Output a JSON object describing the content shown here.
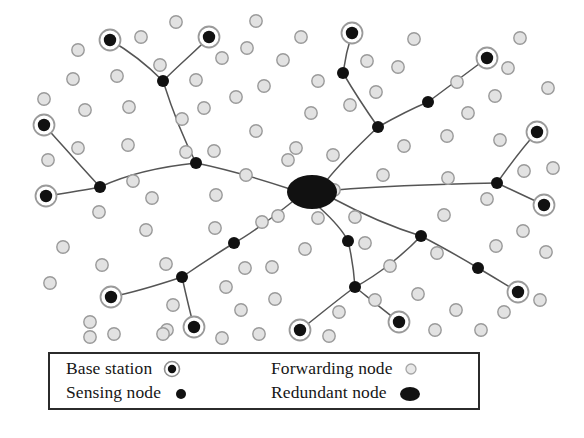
{
  "figure": {
    "background_color": "#ffffff"
  },
  "colors": {
    "base_station_ring": "#9a9a9a",
    "base_station_core": "#111111",
    "sensing_node": "#111111",
    "forwarding_node_fill": "#e2e2e2",
    "forwarding_node_stroke": "#9a9a9a",
    "redundant_node": "#111111",
    "link_line": "#555555",
    "legend_border": "#2b2b2b",
    "legend_text": "#161616"
  },
  "legend": {
    "items": [
      {
        "label": "Base station",
        "symbol": "base-station-symbol",
        "column": "left",
        "row": 1
      },
      {
        "label": "Sensing node",
        "symbol": "sensing-node-symbol",
        "column": "left",
        "row": 2
      },
      {
        "label": "Forwarding node",
        "symbol": "forwarding-node-symbol",
        "column": "right",
        "row": 1
      },
      {
        "label": "Redundant node",
        "symbol": "redundant-node-symbol",
        "column": "right",
        "row": 2
      }
    ]
  },
  "network": {
    "redundant_nodes": [
      {
        "id": "hub",
        "cx": 312,
        "cy": 192,
        "rx": 25,
        "ry": 17
      }
    ],
    "base_stations": [
      {
        "id": "bs1",
        "cx": 110,
        "cy": 40
      },
      {
        "id": "bs2",
        "cx": 209,
        "cy": 37
      },
      {
        "id": "bs3",
        "cx": 352,
        "cy": 33
      },
      {
        "id": "bs4",
        "cx": 487,
        "cy": 58
      },
      {
        "id": "bs5",
        "cx": 44,
        "cy": 125
      },
      {
        "id": "bs6",
        "cx": 537,
        "cy": 132
      },
      {
        "id": "bs7",
        "cx": 46,
        "cy": 196
      },
      {
        "id": "bs8",
        "cx": 544,
        "cy": 205
      },
      {
        "id": "bs9",
        "cx": 111,
        "cy": 297
      },
      {
        "id": "bs10",
        "cx": 194,
        "cy": 327
      },
      {
        "id": "bs11",
        "cx": 300,
        "cy": 330
      },
      {
        "id": "bs12",
        "cx": 399,
        "cy": 322
      },
      {
        "id": "bs13",
        "cx": 518,
        "cy": 292
      }
    ],
    "sensing_nodes": [
      {
        "id": "s1",
        "cx": 163,
        "cy": 81
      },
      {
        "id": "s2",
        "cx": 343,
        "cy": 73
      },
      {
        "id": "s3",
        "cx": 428,
        "cy": 102
      },
      {
        "id": "s4",
        "cx": 378,
        "cy": 127
      },
      {
        "id": "s5",
        "cx": 196,
        "cy": 163
      },
      {
        "id": "s6",
        "cx": 100,
        "cy": 187
      },
      {
        "id": "s7",
        "cx": 497,
        "cy": 183
      },
      {
        "id": "s8",
        "cx": 421,
        "cy": 236
      },
      {
        "id": "s9",
        "cx": 234,
        "cy": 243
      },
      {
        "id": "s10",
        "cx": 348,
        "cy": 241
      },
      {
        "id": "s11",
        "cx": 182,
        "cy": 277
      },
      {
        "id": "s12",
        "cx": 355,
        "cy": 287
      },
      {
        "id": "s13",
        "cx": 478,
        "cy": 268
      }
    ],
    "forwarding_nodes": [
      {
        "cx": 78,
        "cy": 50
      },
      {
        "cx": 141,
        "cy": 37
      },
      {
        "cx": 160,
        "cy": 65
      },
      {
        "cx": 176,
        "cy": 22
      },
      {
        "cx": 222,
        "cy": 58
      },
      {
        "cx": 247,
        "cy": 48
      },
      {
        "cx": 256,
        "cy": 21
      },
      {
        "cx": 196,
        "cy": 80
      },
      {
        "cx": 73,
        "cy": 79
      },
      {
        "cx": 117,
        "cy": 76
      },
      {
        "cx": 129,
        "cy": 107
      },
      {
        "cx": 44,
        "cy": 99
      },
      {
        "cx": 48,
        "cy": 160
      },
      {
        "cx": 78,
        "cy": 148
      },
      {
        "cx": 128,
        "cy": 145
      },
      {
        "cx": 99,
        "cy": 212
      },
      {
        "cx": 63,
        "cy": 247
      },
      {
        "cx": 50,
        "cy": 283
      },
      {
        "cx": 90,
        "cy": 322
      },
      {
        "cx": 90,
        "cy": 337
      },
      {
        "cx": 152,
        "cy": 198
      },
      {
        "cx": 146,
        "cy": 230
      },
      {
        "cx": 166,
        "cy": 264
      },
      {
        "cx": 173,
        "cy": 305
      },
      {
        "cx": 102,
        "cy": 265
      },
      {
        "cx": 133,
        "cy": 181
      },
      {
        "cx": 182,
        "cy": 119
      },
      {
        "cx": 186,
        "cy": 152
      },
      {
        "cx": 216,
        "cy": 195
      },
      {
        "cx": 215,
        "cy": 228
      },
      {
        "cx": 226,
        "cy": 287
      },
      {
        "cx": 241,
        "cy": 310
      },
      {
        "cx": 259,
        "cy": 334
      },
      {
        "cx": 245,
        "cy": 268
      },
      {
        "cx": 262,
        "cy": 222
      },
      {
        "cx": 246,
        "cy": 175
      },
      {
        "cx": 214,
        "cy": 151
      },
      {
        "cx": 256,
        "cy": 131
      },
      {
        "cx": 264,
        "cy": 86
      },
      {
        "cx": 283,
        "cy": 60
      },
      {
        "cx": 301,
        "cy": 37
      },
      {
        "cx": 318,
        "cy": 81
      },
      {
        "cx": 311,
        "cy": 113
      },
      {
        "cx": 288,
        "cy": 160
      },
      {
        "cx": 272,
        "cy": 267
      },
      {
        "cx": 275,
        "cy": 299
      },
      {
        "cx": 305,
        "cy": 249
      },
      {
        "cx": 318,
        "cy": 218
      },
      {
        "cx": 334,
        "cy": 190
      },
      {
        "cx": 333,
        "cy": 155
      },
      {
        "cx": 350,
        "cy": 105
      },
      {
        "cx": 367,
        "cy": 61
      },
      {
        "cx": 376,
        "cy": 92
      },
      {
        "cx": 398,
        "cy": 67
      },
      {
        "cx": 414,
        "cy": 39
      },
      {
        "cx": 404,
        "cy": 146
      },
      {
        "cx": 383,
        "cy": 175
      },
      {
        "cx": 355,
        "cy": 217
      },
      {
        "cx": 339,
        "cy": 312
      },
      {
        "cx": 375,
        "cy": 300
      },
      {
        "cx": 390,
        "cy": 266
      },
      {
        "cx": 418,
        "cy": 294
      },
      {
        "cx": 437,
        "cy": 253
      },
      {
        "cx": 444,
        "cy": 215
      },
      {
        "cx": 448,
        "cy": 178
      },
      {
        "cx": 447,
        "cy": 136
      },
      {
        "cx": 468,
        "cy": 113
      },
      {
        "cx": 457,
        "cy": 82
      },
      {
        "cx": 495,
        "cy": 96
      },
      {
        "cx": 500,
        "cy": 140
      },
      {
        "cx": 508,
        "cy": 68
      },
      {
        "cx": 520,
        "cy": 38
      },
      {
        "cx": 548,
        "cy": 88
      },
      {
        "cx": 553,
        "cy": 168
      },
      {
        "cx": 524,
        "cy": 171
      },
      {
        "cx": 487,
        "cy": 199
      },
      {
        "cx": 496,
        "cy": 246
      },
      {
        "cx": 523,
        "cy": 231
      },
      {
        "cx": 546,
        "cy": 252
      },
      {
        "cx": 504,
        "cy": 312
      },
      {
        "cx": 481,
        "cy": 330
      },
      {
        "cx": 540,
        "cy": 300
      },
      {
        "cx": 435,
        "cy": 330
      },
      {
        "cx": 456,
        "cy": 310
      },
      {
        "cx": 329,
        "cy": 336
      },
      {
        "cx": 222,
        "cy": 338
      },
      {
        "cx": 167,
        "cy": 330
      },
      {
        "cx": 278,
        "cy": 216
      },
      {
        "cx": 204,
        "cy": 108
      },
      {
        "cx": 85,
        "cy": 110
      },
      {
        "cx": 296,
        "cy": 148
      },
      {
        "cx": 365,
        "cy": 243
      },
      {
        "cx": 236,
        "cy": 97
      },
      {
        "cx": 163,
        "cy": 334
      },
      {
        "cx": 114,
        "cy": 334
      },
      {
        "cx": 299,
        "cy": 195
      }
    ],
    "links": [
      {
        "from": "bs1",
        "to": "s1",
        "path": "M 110 40 C 131 52 148 66 163 81"
      },
      {
        "from": "bs2",
        "to": "s1",
        "path": "M 209 37 C 197 50 182 62 163 81"
      },
      {
        "from": "s1",
        "to": "s5",
        "path": "M 163 81 C 171 106 181 134 196 163"
      },
      {
        "from": "s5",
        "to": "hub",
        "path": "M 196 163 C 230 170 263 180 290 189"
      },
      {
        "from": "s5",
        "to": "s6",
        "path": "M 196 163 C 167 166 130 173 100 187"
      },
      {
        "from": "s6",
        "to": "bs5",
        "path": "M 100 187 C 84 170 63 146 44 125"
      },
      {
        "from": "s6",
        "to": "bs7",
        "path": "M 100 187 C 85 190 66 193 46 196"
      },
      {
        "from": "bs3",
        "to": "s2",
        "path": "M 352 33 C 348 46 345 59 343 73"
      },
      {
        "from": "s2",
        "to": "s4",
        "path": "M 343 73 C 353 90 366 110 378 127"
      },
      {
        "from": "s4",
        "to": "s3",
        "path": "M 378 127 C 394 118 411 109 428 102"
      },
      {
        "from": "s3",
        "to": "bs4",
        "path": "M 428 102 C 447 88 468 72 487 58"
      },
      {
        "from": "s4",
        "to": "hub",
        "path": "M 378 127 C 358 146 338 166 327 180"
      },
      {
        "from": "hub",
        "to": "s7",
        "path": "M 336 190 C 380 186 443 184 497 183"
      },
      {
        "from": "s7",
        "to": "bs6",
        "path": "M 497 183 C 509 166 522 148 537 132"
      },
      {
        "from": "s7",
        "to": "bs8",
        "path": "M 497 183 C 512 190 529 198 544 205"
      },
      {
        "from": "hub",
        "to": "s8",
        "path": "M 334 199 C 362 214 392 227 421 236"
      },
      {
        "from": "s8",
        "to": "s13",
        "path": "M 421 236 C 440 246 460 257 478 268"
      },
      {
        "from": "s13",
        "to": "bs13",
        "path": "M 478 268 C 492 276 506 285 518 292"
      },
      {
        "from": "s8",
        "to": "s12",
        "path": "M 421 236 C 404 254 378 275 355 287"
      },
      {
        "from": "s12",
        "to": "bs12",
        "path": "M 355 287 C 370 299 386 312 399 322"
      },
      {
        "from": "s12",
        "to": "bs11",
        "path": "M 355 287 C 337 300 317 317 300 330"
      },
      {
        "from": "hub",
        "to": "s10",
        "path": "M 320 208 C 331 218 342 229 348 241"
      },
      {
        "from": "s10",
        "to": "s12",
        "path": "M 348 241 C 352 257 354 273 355 287"
      },
      {
        "from": "hub",
        "to": "s9",
        "path": "M 292 202 C 273 217 253 233 234 243"
      },
      {
        "from": "s9",
        "to": "s11",
        "path": "M 234 243 C 218 253 198 266 182 277"
      },
      {
        "from": "s11",
        "to": "bs9",
        "path": "M 182 277 C 161 284 135 292 111 297"
      },
      {
        "from": "s11",
        "to": "bs10",
        "path": "M 182 277 C 186 295 190 312 194 327"
      }
    ]
  }
}
